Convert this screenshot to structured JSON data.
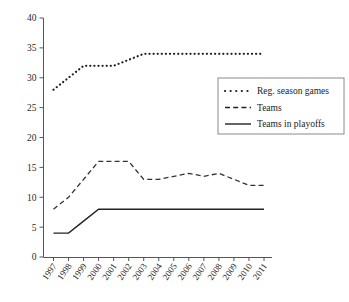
{
  "chart_data": {
    "type": "line",
    "title": "",
    "xlabel": "",
    "ylabel": "",
    "ylim": [
      0,
      40
    ],
    "ytick_step": 5,
    "yticks": [
      "0",
      "5",
      "10",
      "15",
      "20",
      "25",
      "30",
      "35",
      "40"
    ],
    "grid": false,
    "legend_position": "upper-right",
    "categories": [
      "1997",
      "1998",
      "1999",
      "2000",
      "2001",
      "2002",
      "2003",
      "2004",
      "2005",
      "2006",
      "2007",
      "2008",
      "2009",
      "2010",
      "2011"
    ],
    "series": [
      {
        "name": "Reg. season games",
        "style": "dotted",
        "color": "#222222",
        "values": [
          28,
          30,
          32,
          32,
          32,
          33,
          34,
          34,
          34,
          34,
          34,
          34,
          34,
          34,
          34
        ]
      },
      {
        "name": "Teams",
        "style": "dashed",
        "color": "#333333",
        "values": [
          8,
          10,
          13,
          16,
          16,
          16,
          13,
          13,
          13.5,
          14,
          13.5,
          14,
          13,
          12,
          12
        ]
      },
      {
        "name": "Teams in playoffs",
        "style": "solid",
        "color": "#222222",
        "values": [
          4,
          4,
          6,
          8,
          8,
          8,
          8,
          8,
          8,
          8,
          8,
          8,
          8,
          8,
          8
        ]
      }
    ]
  },
  "legend": {
    "items": [
      {
        "label": "Reg. season games",
        "style": "dotted"
      },
      {
        "label": "Teams",
        "style": "dashed"
      },
      {
        "label": "Teams in playoffs",
        "style": "solid"
      }
    ]
  }
}
